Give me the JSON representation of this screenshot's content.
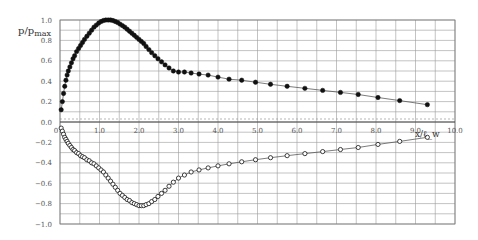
{
  "chart_data": {
    "type": "scatter",
    "title": "",
    "xlabel": "x/c_w",
    "ylabel": "p/p_max",
    "ylabel_main": "p/p",
    "ylabel_sub": "max",
    "xlabel_text": "x/ℓ_w",
    "xlim": [
      0,
      10
    ],
    "ylim": [
      -1.0,
      1.0
    ],
    "grid": true,
    "x_ticks": [
      "0",
      "1.0",
      "2.0",
      "3.0",
      "4.0",
      "5.0",
      "6.0",
      "7.0",
      "8.0",
      "9.0",
      "10.0"
    ],
    "y_ticks": [
      "1.0",
      "0.8",
      "0.6",
      "0.4",
      "0.2",
      "0.0",
      "-0.2",
      "-0.4",
      "-0.6",
      "-0.8",
      "-1.0"
    ],
    "series": [
      {
        "name": "positive pressure (filled markers)",
        "marker": "filled-circle",
        "x": [
          0.03,
          0.06,
          0.09,
          0.12,
          0.15,
          0.18,
          0.21,
          0.25,
          0.29,
          0.33,
          0.37,
          0.42,
          0.47,
          0.52,
          0.57,
          0.62,
          0.68,
          0.74,
          0.8,
          0.86,
          0.92,
          0.98,
          1.04,
          1.1,
          1.16,
          1.22,
          1.28,
          1.34,
          1.4,
          1.46,
          1.52,
          1.58,
          1.64,
          1.7,
          1.76,
          1.82,
          1.88,
          1.94,
          2.0,
          2.06,
          2.12,
          2.18,
          2.25,
          2.32,
          2.4,
          2.48,
          2.57,
          2.66,
          2.76,
          2.87,
          3.0,
          3.15,
          3.32,
          3.52,
          3.75,
          4.0,
          4.28,
          4.6,
          4.95,
          5.33,
          5.75,
          6.2,
          6.65,
          7.1,
          7.55,
          8.05,
          8.6,
          9.3
        ],
        "y": [
          0.12,
          0.2,
          0.28,
          0.35,
          0.41,
          0.46,
          0.5,
          0.54,
          0.58,
          0.62,
          0.65,
          0.69,
          0.72,
          0.75,
          0.78,
          0.81,
          0.84,
          0.87,
          0.9,
          0.93,
          0.95,
          0.97,
          0.985,
          0.995,
          1.0,
          1.0,
          1.0,
          0.995,
          0.985,
          0.975,
          0.96,
          0.945,
          0.93,
          0.91,
          0.89,
          0.87,
          0.85,
          0.83,
          0.81,
          0.79,
          0.77,
          0.74,
          0.71,
          0.68,
          0.65,
          0.62,
          0.59,
          0.56,
          0.53,
          0.5,
          0.49,
          0.49,
          0.48,
          0.47,
          0.46,
          0.44,
          0.42,
          0.41,
          0.39,
          0.37,
          0.35,
          0.33,
          0.31,
          0.29,
          0.27,
          0.24,
          0.21,
          0.17
        ]
      },
      {
        "name": "negative pressure (open markers)",
        "marker": "open-circle",
        "x": [
          0.03,
          0.06,
          0.09,
          0.12,
          0.15,
          0.18,
          0.21,
          0.25,
          0.29,
          0.33,
          0.37,
          0.42,
          0.47,
          0.52,
          0.57,
          0.62,
          0.68,
          0.74,
          0.8,
          0.86,
          0.92,
          0.98,
          1.04,
          1.1,
          1.16,
          1.22,
          1.28,
          1.34,
          1.4,
          1.46,
          1.52,
          1.58,
          1.64,
          1.7,
          1.76,
          1.82,
          1.88,
          1.94,
          2.0,
          2.06,
          2.12,
          2.18,
          2.25,
          2.32,
          2.4,
          2.48,
          2.57,
          2.66,
          2.76,
          2.87,
          3.0,
          3.15,
          3.32,
          3.52,
          3.75,
          4.0,
          4.28,
          4.6,
          4.95,
          5.33,
          5.75,
          6.2,
          6.65,
          7.1,
          7.55,
          8.05,
          8.6,
          9.3
        ],
        "y": [
          -0.06,
          -0.09,
          -0.12,
          -0.15,
          -0.17,
          -0.19,
          -0.21,
          -0.23,
          -0.25,
          -0.27,
          -0.28,
          -0.3,
          -0.31,
          -0.33,
          -0.34,
          -0.35,
          -0.37,
          -0.38,
          -0.4,
          -0.41,
          -0.43,
          -0.45,
          -0.47,
          -0.49,
          -0.52,
          -0.55,
          -0.58,
          -0.61,
          -0.64,
          -0.67,
          -0.7,
          -0.72,
          -0.74,
          -0.76,
          -0.77,
          -0.79,
          -0.8,
          -0.81,
          -0.82,
          -0.82,
          -0.82,
          -0.81,
          -0.8,
          -0.78,
          -0.76,
          -0.73,
          -0.7,
          -0.67,
          -0.63,
          -0.59,
          -0.55,
          -0.52,
          -0.49,
          -0.47,
          -0.45,
          -0.43,
          -0.41,
          -0.39,
          -0.37,
          -0.35,
          -0.33,
          -0.31,
          -0.29,
          -0.27,
          -0.25,
          -0.22,
          -0.19,
          -0.15
        ]
      }
    ]
  }
}
